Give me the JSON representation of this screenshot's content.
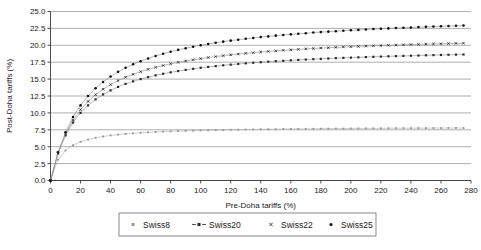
{
  "chart_data": {
    "type": "scatter",
    "title": "",
    "xlabel": "Pre-Doha tariffs (%)",
    "ylabel": "Post-Doha tariffs (%)",
    "xlim": [
      0,
      280
    ],
    "ylim": [
      0,
      25
    ],
    "xticks": [
      0,
      20,
      40,
      60,
      80,
      100,
      120,
      140,
      160,
      180,
      200,
      220,
      240,
      260,
      280
    ],
    "yticks": [
      0.0,
      2.5,
      5.0,
      7.5,
      10.0,
      12.5,
      15.0,
      17.5,
      20.0,
      22.5,
      25.0
    ],
    "xtick_labels": [
      "0",
      "20",
      "40",
      "60",
      "80",
      "100",
      "120",
      "140",
      "160",
      "180",
      "200",
      "220",
      "240",
      "260",
      "280"
    ],
    "ytick_labels": [
      "0.0",
      "2.5",
      "5.0",
      "7.5",
      "10.0",
      "12.5",
      "15.0",
      "17.5",
      "20.0",
      "22.5",
      "25.0"
    ],
    "grid": "horizontal",
    "legend_position": "bottom",
    "x": [
      0,
      5,
      10,
      15,
      20,
      25,
      30,
      35,
      40,
      45,
      50,
      55,
      60,
      65,
      70,
      75,
      80,
      85,
      90,
      95,
      100,
      105,
      110,
      115,
      120,
      125,
      130,
      135,
      140,
      145,
      150,
      155,
      160,
      165,
      170,
      175,
      180,
      185,
      190,
      195,
      200,
      205,
      210,
      215,
      220,
      225,
      230,
      235,
      240,
      245,
      250,
      255,
      260,
      265,
      270,
      275
    ],
    "series": [
      {
        "name": "Swiss8",
        "coefficient": 8,
        "marker": "square",
        "color": "#9a9a9a",
        "values": [
          0.0,
          3.08,
          4.44,
          5.22,
          5.71,
          6.06,
          6.32,
          6.51,
          6.67,
          6.79,
          6.9,
          6.98,
          7.06,
          7.12,
          7.18,
          7.23,
          7.27,
          7.31,
          7.35,
          7.38,
          7.41,
          7.43,
          7.46,
          7.48,
          7.5,
          7.52,
          7.54,
          7.55,
          7.57,
          7.58,
          7.59,
          7.61,
          7.62,
          7.63,
          7.64,
          7.65,
          7.66,
          7.67,
          7.68,
          7.68,
          7.69,
          7.7,
          7.71,
          7.71,
          7.72,
          7.73,
          7.73,
          7.74,
          7.74,
          7.75,
          7.75,
          7.76,
          7.76,
          7.77,
          7.77,
          7.77
        ]
      },
      {
        "name": "Swiss20",
        "coefficient": 20,
        "marker": "square-dashed",
        "color": "#2b2b2b",
        "values": [
          0.0,
          4.0,
          6.67,
          8.57,
          10.0,
          11.11,
          12.0,
          12.73,
          13.33,
          13.85,
          14.29,
          14.67,
          15.0,
          15.29,
          15.56,
          15.79,
          16.0,
          16.19,
          16.36,
          16.52,
          16.67,
          16.8,
          16.92,
          17.04,
          17.14,
          17.24,
          17.33,
          17.42,
          17.5,
          17.58,
          17.65,
          17.71,
          17.78,
          17.84,
          17.89,
          17.95,
          18.0,
          18.05,
          18.1,
          18.14,
          18.18,
          18.22,
          18.26,
          18.3,
          18.33,
          18.37,
          18.4,
          18.43,
          18.46,
          18.49,
          18.52,
          18.55,
          18.57,
          18.6,
          18.62,
          18.64
        ]
      },
      {
        "name": "Swiss22",
        "coefficient": 22,
        "marker": "cross",
        "color": "#2b2b2b",
        "values": [
          0.0,
          4.07,
          6.88,
          8.92,
          10.48,
          11.7,
          12.69,
          13.51,
          14.19,
          14.78,
          15.28,
          15.71,
          16.1,
          16.44,
          16.74,
          17.01,
          17.26,
          17.48,
          17.68,
          17.87,
          18.03,
          18.19,
          18.33,
          18.47,
          18.59,
          18.71,
          18.81,
          18.91,
          19.01,
          19.1,
          19.18,
          19.26,
          19.33,
          19.4,
          19.47,
          19.53,
          19.59,
          19.64,
          19.7,
          19.75,
          19.8,
          19.84,
          19.88,
          19.92,
          19.96,
          20.0,
          20.04,
          20.07,
          20.11,
          20.14,
          20.17,
          20.2,
          20.23,
          20.25,
          20.28,
          20.31
        ]
      },
      {
        "name": "Swiss25",
        "coefficient": 25,
        "marker": "circle",
        "color": "#111111",
        "values": [
          0.0,
          4.17,
          7.14,
          9.38,
          11.11,
          12.5,
          13.64,
          14.58,
          15.38,
          16.07,
          16.67,
          17.19,
          17.65,
          18.06,
          18.42,
          18.75,
          19.05,
          19.32,
          19.57,
          19.79,
          20.0,
          20.19,
          20.37,
          20.54,
          20.69,
          20.83,
          20.97,
          21.09,
          21.21,
          21.32,
          21.43,
          21.53,
          21.62,
          21.71,
          21.79,
          21.88,
          21.95,
          22.02,
          22.09,
          22.16,
          22.22,
          22.28,
          22.34,
          22.4,
          22.45,
          22.5,
          22.55,
          22.6,
          22.64,
          22.69,
          22.73,
          22.77,
          22.81,
          22.85,
          22.88,
          22.92
        ]
      }
    ]
  },
  "legend": {
    "items": [
      {
        "label": "Swiss8"
      },
      {
        "label": "Swiss20"
      },
      {
        "label": "Swiss22"
      },
      {
        "label": "Swiss25"
      }
    ]
  }
}
